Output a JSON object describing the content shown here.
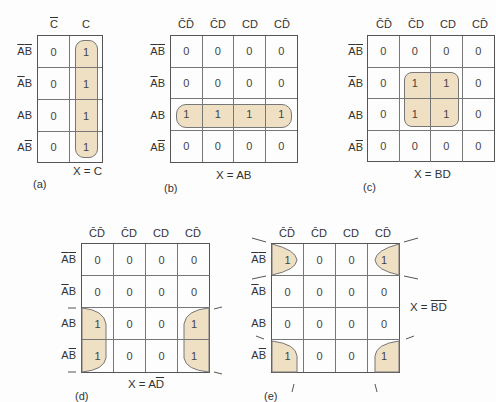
{
  "diagrams": [
    {
      "id": "a",
      "label": "(a)",
      "equation": "X = C",
      "col_headers": [
        {
          "text": "C",
          "bar": true
        },
        {
          "text": "C",
          "bar": false
        }
      ],
      "row_headers": [
        {
          "a_bar": true,
          "b_bar": true
        },
        {
          "a_bar": true,
          "b_bar": false
        },
        {
          "a_bar": false,
          "b_bar": false
        },
        {
          "a_bar": false,
          "b_bar": true
        }
      ],
      "cells": [
        [
          "0",
          "1"
        ],
        [
          "0",
          "1"
        ],
        [
          "0",
          "1"
        ],
        [
          "0",
          "1"
        ]
      ]
    },
    {
      "id": "b",
      "label": "(b)",
      "equation": "X = AB",
      "col_headers": [
        "C̄D̄",
        "C̄D",
        "CD",
        "CD̄"
      ],
      "cells": [
        [
          "0",
          "0",
          "0",
          "0"
        ],
        [
          "0",
          "0",
          "0",
          "0"
        ],
        [
          "1",
          "1",
          "1",
          "1"
        ],
        [
          "0",
          "0",
          "0",
          "0"
        ]
      ]
    },
    {
      "id": "c",
      "label": "(c)",
      "equation": "X = BD",
      "col_headers": [
        "C̄D̄",
        "C̄D",
        "CD",
        "CD̄"
      ],
      "cells": [
        [
          "0",
          "0",
          "0",
          "0"
        ],
        [
          "0",
          "1",
          "1",
          "0"
        ],
        [
          "0",
          "1",
          "1",
          "0"
        ],
        [
          "0",
          "0",
          "0",
          "0"
        ]
      ]
    },
    {
      "id": "d",
      "label": "(d)",
      "equation_prefix": "X = A",
      "equation_bar": "D",
      "col_headers": [
        "C̄D̄",
        "C̄D",
        "CD",
        "CD̄"
      ],
      "cells": [
        [
          "0",
          "0",
          "0",
          "0"
        ],
        [
          "0",
          "0",
          "0",
          "0"
        ],
        [
          "1",
          "0",
          "0",
          "1"
        ],
        [
          "1",
          "0",
          "0",
          "1"
        ]
      ]
    },
    {
      "id": "e",
      "label": "(e)",
      "equation_prefix": "X = ",
      "equation_bar": "BD",
      "col_headers": [
        "C̄D̄",
        "C̄D",
        "CD",
        "CD̄"
      ],
      "cells": [
        [
          "1",
          "0",
          "0",
          "1"
        ],
        [
          "0",
          "0",
          "0",
          "0"
        ],
        [
          "0",
          "0",
          "0",
          "0"
        ],
        [
          "1",
          "0",
          "0",
          "1"
        ]
      ]
    }
  ],
  "row_labels": {
    "ab_bar_bar": "AB",
    "ab_bar_a": "AB",
    "ab": "AB",
    "ab_bar_b": "AB"
  },
  "colors": {
    "loop_fill": "#efe0c4",
    "grid_line": "#555555",
    "text": "#333333"
  }
}
